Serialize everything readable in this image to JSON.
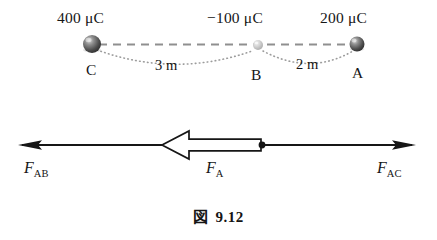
{
  "figure": {
    "caption_symbol": "図",
    "caption_number": "9.12",
    "caption_full": "図 9.12"
  },
  "charges": [
    {
      "name": "C",
      "point_label": "C",
      "charge_text": "400 μC",
      "charge_value": 400,
      "charge_unit": "μC",
      "charge_sign": "+",
      "x": 92,
      "y": 44,
      "radius": 9,
      "shade": "dark"
    },
    {
      "name": "B",
      "point_label": "B",
      "charge_text": "−100 μC",
      "charge_value": -100,
      "charge_unit": "μC",
      "charge_sign": "−",
      "x": 258,
      "y": 45,
      "radius": 5,
      "shade": "light"
    },
    {
      "name": "A",
      "point_label": "A",
      "charge_text": "200 μC",
      "charge_value": 200,
      "charge_unit": "μC",
      "charge_sign": "+",
      "x": 357,
      "y": 44,
      "radius": 7.5,
      "shade": "dark"
    }
  ],
  "distances": [
    {
      "label": "3 m",
      "value": 3,
      "unit": "m",
      "from": "C",
      "to": "B"
    },
    {
      "label": "2 m",
      "value": 2,
      "unit": "m",
      "from": "B",
      "to": "A"
    }
  ],
  "forces": [
    {
      "key": "F_AB",
      "symbol": "F",
      "subscript": "AB",
      "direction": "left",
      "style": "thin-arrow"
    },
    {
      "key": "F_A",
      "symbol": "F",
      "subscript": "A",
      "direction": "left",
      "style": "hollow-block-arrow"
    },
    {
      "key": "F_AC",
      "symbol": "F",
      "subscript": "AC",
      "direction": "right",
      "style": "thin-arrow"
    }
  ],
  "colors": {
    "ink": "#161616",
    "dashed_line": "#8c8c8c",
    "dotted_arc": "#9a9a9a",
    "sphere_dark": "#4a4a4a",
    "sphere_light": "#c9c9c9",
    "background": "#ffffff"
  }
}
